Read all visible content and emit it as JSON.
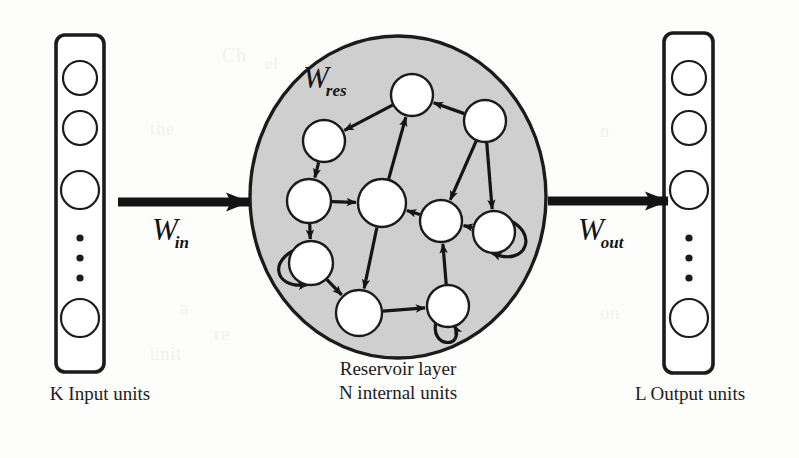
{
  "figure": {
    "type": "echo-state-network-architecture",
    "background_color": "#fdfdfc",
    "ink_color": "#1b1b1b",
    "reservoir_fill": "#cfcfcf"
  },
  "labels": {
    "w_in_base": "W",
    "w_in_sub": "in",
    "w_res_base": "W",
    "w_res_sub": "res",
    "w_out_base": "W",
    "w_out_sub": "out"
  },
  "captions": {
    "input": "K Input units",
    "reservoir_line1": "Reservoir layer",
    "reservoir_line2": "N internal units",
    "output": "L Output units"
  },
  "input_layer": {
    "name": "K Input units",
    "box": {
      "x": 56,
      "y": 35,
      "width": 48,
      "height": 337,
      "rx": 9
    },
    "units": [
      {
        "cx": 80,
        "cy": 78,
        "r": 17
      },
      {
        "cx": 80,
        "cy": 128,
        "r": 17
      },
      {
        "cx": 80,
        "cy": 190,
        "r": 19
      },
      {
        "cx": 80,
        "cy": 318,
        "r": 19
      }
    ],
    "ellipsis_dots": [
      {
        "cx": 80,
        "cy": 238,
        "r": 3.6
      },
      {
        "cx": 80,
        "cy": 258,
        "r": 3.6
      },
      {
        "cx": 80,
        "cy": 278,
        "r": 3.6
      }
    ]
  },
  "output_layer": {
    "name": "L Output units",
    "box": {
      "x": 664,
      "y": 33,
      "width": 49,
      "height": 340,
      "rx": 9
    },
    "units": [
      {
        "cx": 689,
        "cy": 78,
        "r": 17
      },
      {
        "cx": 689,
        "cy": 128,
        "r": 17
      },
      {
        "cx": 689,
        "cy": 190,
        "r": 19
      },
      {
        "cx": 689,
        "cy": 318,
        "r": 19
      }
    ],
    "ellipsis_dots": [
      {
        "cx": 689,
        "cy": 238,
        "r": 3.6
      },
      {
        "cx": 689,
        "cy": 258,
        "r": 3.6
      },
      {
        "cx": 689,
        "cy": 278,
        "r": 3.6
      }
    ]
  },
  "reservoir": {
    "name": "Reservoir layer",
    "ellipse": {
      "cx": 398,
      "cy": 197,
      "rx": 148,
      "ry": 161
    },
    "nodes": [
      {
        "id": "n1",
        "cx": 412,
        "cy": 95,
        "r": 21
      },
      {
        "id": "n2",
        "cx": 485,
        "cy": 121,
        "r": 21
      },
      {
        "id": "n3",
        "cx": 324,
        "cy": 141,
        "r": 21
      },
      {
        "id": "n4",
        "cx": 309,
        "cy": 201,
        "r": 22
      },
      {
        "id": "n5",
        "cx": 382,
        "cy": 203,
        "r": 24
      },
      {
        "id": "n6",
        "cx": 441,
        "cy": 221,
        "r": 21
      },
      {
        "id": "n7",
        "cx": 494,
        "cy": 232,
        "r": 21
      },
      {
        "id": "n8",
        "cx": 311,
        "cy": 263,
        "r": 22
      },
      {
        "id": "n9",
        "cx": 359,
        "cy": 313,
        "r": 23
      },
      {
        "id": "n10",
        "cx": 448,
        "cy": 306,
        "r": 21
      }
    ],
    "edges": [
      {
        "from": "n1",
        "to": "n3"
      },
      {
        "from": "n2",
        "to": "n1"
      },
      {
        "from": "n2",
        "to": "n6"
      },
      {
        "from": "n2",
        "to": "n7"
      },
      {
        "from": "n3",
        "to": "n4"
      },
      {
        "from": "n4",
        "to": "n5"
      },
      {
        "from": "n4",
        "to": "n8"
      },
      {
        "from": "n5",
        "to": "n1"
      },
      {
        "from": "n5",
        "to": "n9"
      },
      {
        "from": "n6",
        "to": "n5"
      },
      {
        "from": "n7",
        "to": "n6"
      },
      {
        "from": "n8",
        "to": "n9"
      },
      {
        "from": "n9",
        "to": "n10"
      },
      {
        "from": "n10",
        "to": "n6"
      }
    ],
    "self_loops": [
      {
        "node": "n8",
        "side": "left"
      },
      {
        "node": "n7",
        "side": "right"
      },
      {
        "node": "n10",
        "side": "bottom"
      }
    ]
  },
  "connections": {
    "input_arrow": {
      "x1": 118,
      "y1": 202,
      "x2": 249,
      "y2": 202
    },
    "output_arrow": {
      "x1": 548,
      "y1": 201,
      "x2": 668,
      "y2": 201
    }
  },
  "bleed_text": [
    {
      "text": "Ch",
      "x": 222,
      "y": 44,
      "size": 20
    },
    {
      "text": "el",
      "x": 265,
      "y": 54,
      "size": 17
    },
    {
      "text": "the",
      "x": 150,
      "y": 118,
      "size": 19
    },
    {
      "text": "d of",
      "x": 70,
      "y": 120,
      "size": 19
    },
    {
      "text": "n",
      "x": 600,
      "y": 120,
      "size": 19
    },
    {
      "text": "a",
      "x": 180,
      "y": 297,
      "size": 19
    },
    {
      "text": "the",
      "x": 450,
      "y": 300,
      "size": 19
    },
    {
      "text": "on",
      "x": 600,
      "y": 302,
      "size": 19
    },
    {
      "text": "re",
      "x": 214,
      "y": 323,
      "size": 19
    },
    {
      "text": "unit",
      "x": 150,
      "y": 343,
      "size": 19
    }
  ]
}
